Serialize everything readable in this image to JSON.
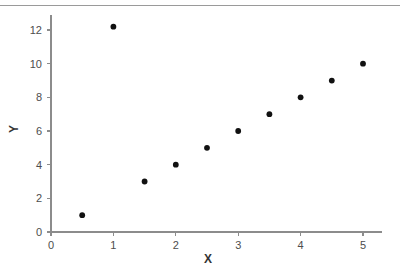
{
  "chart_data": {
    "type": "scatter",
    "title": "",
    "subtitle": "",
    "xlabel": "X",
    "ylabel": "Y",
    "x": [
      0.5,
      1,
      1.5,
      2,
      2.5,
      3,
      3.5,
      4,
      4.5,
      5
    ],
    "y": [
      1,
      12.2,
      3,
      4,
      5,
      6,
      7,
      8,
      9,
      10
    ],
    "points": [
      {
        "x": 0.5,
        "y": 1
      },
      {
        "x": 1,
        "y": 12.2
      },
      {
        "x": 1.5,
        "y": 3
      },
      {
        "x": 2,
        "y": 4
      },
      {
        "x": 2.5,
        "y": 5
      },
      {
        "x": 3,
        "y": 6
      },
      {
        "x": 3.5,
        "y": 7
      },
      {
        "x": 4,
        "y": 8
      },
      {
        "x": 4.5,
        "y": 9
      },
      {
        "x": 5,
        "y": 10
      }
    ],
    "series": [
      {
        "name": "",
        "marker": "circle",
        "color": "#111111",
        "values": [
          1,
          12.2,
          3,
          4,
          5,
          6,
          7,
          8,
          9,
          10
        ]
      }
    ],
    "xlim": [
      0,
      5.5
    ],
    "ylim": [
      0,
      13
    ],
    "xticks": [
      0,
      1,
      2,
      3,
      4,
      5
    ],
    "yticks": [
      0,
      2,
      4,
      6,
      8,
      10,
      12
    ],
    "xtick_labels": [
      "0",
      "1",
      "2",
      "3",
      "4",
      "5"
    ],
    "ytick_labels": [
      "0",
      "2",
      "4",
      "6",
      "8",
      "10",
      "12"
    ],
    "grid": false,
    "legend": false,
    "legend_position": "none",
    "annotations": [],
    "colors": {
      "marker": "#111111",
      "axis": "#8c8c8c",
      "tick_label": "#4d4d4d",
      "axis_title": "#333333",
      "top_rule": "#9a9a9a",
      "background": "#ffffff"
    }
  },
  "figure": {
    "top_rule_visible": true
  }
}
